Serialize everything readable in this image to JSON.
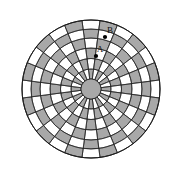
{
  "figure": {
    "kind": "polar-checkerboard-diagram",
    "background_color": "#ffffff",
    "outline_color": "#1a1a1a",
    "fill_shaded": "#a8a8a8",
    "fill_light": "#ffffff",
    "hub_color": "#a8a8a8",
    "center": {
      "x": 91,
      "y": 89
    },
    "outer_radius": 69,
    "hub_radius": 10,
    "sector_count": 24,
    "ring_radii": [
      10,
      20,
      30.5,
      41,
      51,
      60,
      69
    ],
    "checker_origin_parity": 0
  },
  "markers": [
    {
      "id": "marker-b",
      "label": "B",
      "label_x": 110,
      "label_y": 31,
      "dot_x": 105,
      "dot_y": 37,
      "dot_radius": 2.1
    },
    {
      "id": "marker-a",
      "label": "A",
      "label_x": 100,
      "label_y": 50,
      "dot_x": 96,
      "dot_y": 56,
      "dot_radius": 2.1
    }
  ],
  "labels": {
    "marker_b_text": "B",
    "marker_a_text": "A"
  }
}
